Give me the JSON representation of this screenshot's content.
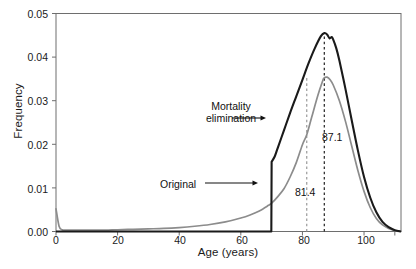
{
  "chart_data": {
    "type": "line",
    "title": "",
    "xlabel": "Age (years)",
    "ylabel": "Frequency",
    "xlim": [
      0,
      112
    ],
    "ylim": [
      0,
      0.05
    ],
    "grid": false,
    "legend_position": "none",
    "xticks": [
      0,
      20,
      40,
      60,
      80,
      100
    ],
    "xticklabels": [
      "0",
      "20",
      "40",
      "60",
      "80",
      "100"
    ],
    "yticks": [
      0.0,
      0.01,
      0.02,
      0.03,
      0.04,
      0.05
    ],
    "yticklabels": [
      "0.00",
      "0.01",
      "0.02",
      "0.03",
      "0.04",
      "0.05"
    ],
    "series": [
      {
        "name": "Original",
        "color": "#8c8c8c",
        "x": [
          0,
          1,
          2,
          3,
          5,
          8,
          12,
          16,
          20,
          25,
          30,
          35,
          40,
          45,
          50,
          55,
          60,
          63,
          66,
          69,
          70,
          72,
          74,
          76,
          78,
          80,
          81.4,
          83,
          85,
          86.5,
          87,
          88,
          89,
          90,
          92,
          94,
          96,
          98,
          100,
          102,
          104,
          106,
          108,
          110,
          112
        ],
        "y": [
          0.0052,
          0.0012,
          0.0004,
          0.0003,
          0.0003,
          0.0003,
          0.0003,
          0.0003,
          0.0004,
          0.0005,
          0.0006,
          0.0007,
          0.0009,
          0.0012,
          0.0016,
          0.0022,
          0.0031,
          0.0038,
          0.0047,
          0.006,
          0.0065,
          0.008,
          0.0098,
          0.0125,
          0.0158,
          0.0199,
          0.0222,
          0.0262,
          0.0312,
          0.0344,
          0.0352,
          0.0354,
          0.0348,
          0.0336,
          0.03,
          0.0252,
          0.0196,
          0.014,
          0.0092,
          0.0055,
          0.003,
          0.0015,
          0.0007,
          0.0002,
          0.0
        ]
      },
      {
        "name": "Mortality elimination",
        "color": "#1a1a1a",
        "x": [
          0,
          20,
          40,
          60,
          69.9,
          70,
          71,
          72,
          74,
          76,
          78,
          80,
          82,
          84,
          86,
          87.1,
          88,
          88.8,
          89.5,
          90,
          91,
          92,
          94,
          96,
          98,
          100,
          102,
          104,
          106,
          108,
          110,
          112
        ],
        "y": [
          0,
          0,
          0,
          0,
          0,
          0.016,
          0.0172,
          0.0192,
          0.0232,
          0.0272,
          0.031,
          0.0348,
          0.0386,
          0.042,
          0.0448,
          0.0455,
          0.0452,
          0.0443,
          0.0446,
          0.044,
          0.042,
          0.0392,
          0.0326,
          0.0255,
          0.0186,
          0.0125,
          0.0078,
          0.0044,
          0.0022,
          0.001,
          0.0003,
          0.0
        ]
      }
    ],
    "vlines": [
      {
        "name": "original-mean",
        "x": 81.4,
        "label": "81.4",
        "color": "#9a9a9a",
        "style": "dashed"
      },
      {
        "name": "mortality-elimination-mean",
        "x": 87.1,
        "label": "87.1",
        "color": "#222222",
        "style": "dashed"
      }
    ],
    "annotations": [
      {
        "name": "mortality-elimination",
        "text_line1": "Mortality",
        "text_line2": "elimination",
        "arrow": "right"
      },
      {
        "name": "original",
        "text_line1": "Original",
        "text_line2": "",
        "arrow": "right"
      }
    ]
  }
}
